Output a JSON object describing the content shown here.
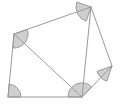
{
  "figure": {
    "type": "geometry-diagram",
    "canvas": {
      "width": 127,
      "height": 105,
      "background": "#ffffff"
    },
    "style": {
      "stroke": "#9a9a9a",
      "stroke_width": 1,
      "angle_fill": "#cfcfcf",
      "angle_stroke": "#9a9a9a",
      "polygon_fill": "none"
    },
    "vertices": [
      {
        "id": "A",
        "name": "top-left-vertex",
        "x": 14,
        "y": 34
      },
      {
        "id": "B",
        "name": "top-vertex",
        "x": 91,
        "y": 7
      },
      {
        "id": "C",
        "name": "right-vertex",
        "x": 112,
        "y": 66
      },
      {
        "id": "D",
        "name": "bottom-right-vertex",
        "x": 82,
        "y": 97
      },
      {
        "id": "E",
        "name": "bottom-left-vertex",
        "x": 8,
        "y": 97
      }
    ],
    "outline": "14,34 91,7 112,66 82,97 8,97",
    "edges": [
      {
        "id": "AB",
        "name": "top-edge",
        "from": "A",
        "to": "B",
        "x1": 14,
        "y1": 34,
        "x2": 91,
        "y2": 7
      },
      {
        "id": "BC",
        "name": "upper-right-edge",
        "from": "B",
        "to": "C",
        "x1": 91,
        "y1": 7,
        "x2": 112,
        "y2": 66
      },
      {
        "id": "CD",
        "name": "lower-right-edge",
        "from": "C",
        "to": "D",
        "x1": 112,
        "y1": 66,
        "x2": 82,
        "y2": 97
      },
      {
        "id": "DE",
        "name": "bottom-edge",
        "from": "D",
        "to": "E",
        "x1": 82,
        "y1": 97,
        "x2": 8,
        "y2": 97
      },
      {
        "id": "EA",
        "name": "left-edge",
        "from": "E",
        "to": "A",
        "x1": 8,
        "y1": 97,
        "x2": 14,
        "y2": 34
      }
    ],
    "diagonals": [
      {
        "id": "AD",
        "name": "diagonal-top-left-to-bottom-right",
        "from": "A",
        "to": "D",
        "x1": 14,
        "y1": 34,
        "x2": 82,
        "y2": 97
      },
      {
        "id": "BD",
        "name": "diagonal-top-to-bottom-right",
        "from": "B",
        "to": "D",
        "x1": 91,
        "y1": 7,
        "x2": 82,
        "y2": 97
      }
    ],
    "angle_marks": [
      {
        "id": "angle-A",
        "name": "angle-mark-top-left",
        "vertex": "A",
        "cx": 14,
        "cy": 34,
        "radius": 14,
        "start_deg": -19,
        "end_deg": 95,
        "shape": "sector"
      },
      {
        "id": "angle-B",
        "name": "angle-mark-top",
        "vertex": "B",
        "cx": 91,
        "cy": 7,
        "radius": 15,
        "start_deg": 109,
        "end_deg": 199,
        "shape": "sector"
      },
      {
        "id": "angle-C",
        "name": "angle-mark-right",
        "vertex": "C",
        "cx": 112,
        "cy": 66,
        "radius": 16,
        "start_deg": 109,
        "end_deg": 160,
        "shape": "sector"
      },
      {
        "id": "angle-D",
        "name": "angle-mark-bottom-right",
        "vertex": "D",
        "cx": 82,
        "cy": 97,
        "radius": 14,
        "start_deg": 180,
        "end_deg": 314,
        "shape": "sector"
      },
      {
        "id": "angle-E",
        "name": "angle-mark-bottom-left",
        "vertex": "E",
        "cx": 8,
        "cy": 97,
        "radius": 13,
        "start_deg": 275,
        "end_deg": 360,
        "shape": "sector"
      }
    ]
  }
}
